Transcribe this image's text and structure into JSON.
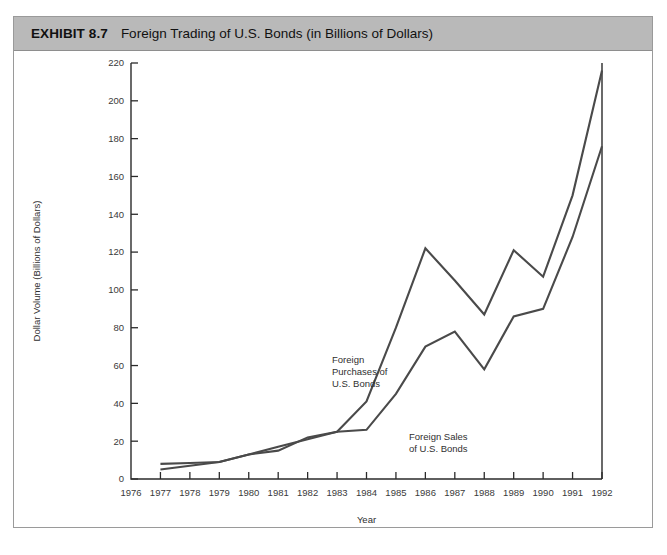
{
  "exhibit": {
    "label": "EXHIBIT 8.7",
    "title": "Foreign Trading of U.S. Bonds (in Billions of Dollars)"
  },
  "colors": {
    "header_background": "#b9b9b9",
    "frame_border": "#9a9a9a",
    "axis": "#2b2b2b",
    "series_line": "#4a4a4a",
    "panel_background": "#ffffff"
  },
  "annotations": [
    {
      "id": "purchases",
      "lines": [
        "Foreign",
        "Purchases of",
        "U.S. Bonds"
      ]
    },
    {
      "id": "sales",
      "lines": [
        "Foreign Sales",
        "of U.S. Bonds"
      ]
    }
  ],
  "chart_data": {
    "type": "line",
    "title": "Foreign Trading of U.S. Bonds (in Billions of Dollars)",
    "xlabel": "Year",
    "ylabel": "Dollar Volume (Billions of Dollars)",
    "xlim": [
      1976,
      1992
    ],
    "ylim": [
      0,
      220
    ],
    "grid": false,
    "legend": "in-plot annotations",
    "x": [
      1976,
      1977,
      1978,
      1979,
      1980,
      1981,
      1982,
      1983,
      1984,
      1985,
      1986,
      1987,
      1988,
      1989,
      1990,
      1991,
      1992
    ],
    "xticklabels": [
      "1976",
      "1977",
      "1978",
      "1979",
      "1980",
      "1981",
      "1982",
      "1983",
      "1984",
      "1985",
      "1986",
      "1987",
      "1988",
      "1989",
      "1990",
      "1991",
      "1992"
    ],
    "yticks": [
      0,
      20,
      40,
      60,
      80,
      100,
      120,
      140,
      160,
      180,
      200,
      220
    ],
    "yticklabels": [
      "0",
      "20",
      "40",
      "60",
      "80",
      "100",
      "120",
      "140",
      "160",
      "180",
      "200",
      "220"
    ],
    "series": [
      {
        "name": "Foreign Purchases of U.S. Bonds",
        "x": [
          1977,
          1978,
          1979,
          1980,
          1981,
          1982,
          1983,
          1984,
          1985,
          1986,
          1987,
          1988,
          1989,
          1990,
          1991,
          1992
        ],
        "values": [
          8,
          8.5,
          9,
          13,
          15,
          22,
          25,
          41,
          80,
          122,
          105,
          87,
          121,
          107,
          150,
          216
        ]
      },
      {
        "name": "Foreign Sales of U.S. Bonds",
        "x": [
          1977,
          1978,
          1979,
          1980,
          1981,
          1982,
          1983,
          1984,
          1985,
          1986,
          1987,
          1988,
          1989,
          1990,
          1991,
          1992
        ],
        "values": [
          5,
          7,
          9,
          13,
          17,
          21,
          25,
          26,
          45,
          70,
          78,
          58,
          86,
          90,
          128,
          176
        ]
      }
    ]
  }
}
